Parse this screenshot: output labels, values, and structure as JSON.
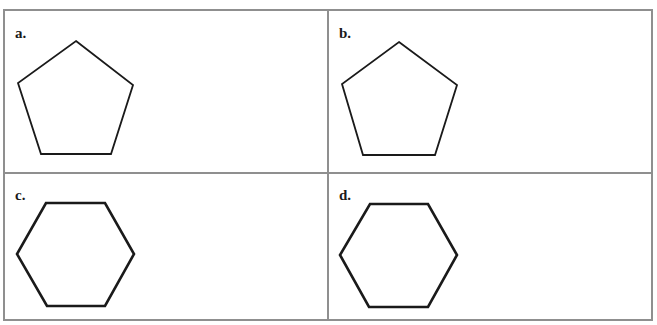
{
  "figure": {
    "cells": [
      {
        "id": "a",
        "label": "a.",
        "shape": "pentagon"
      },
      {
        "id": "b",
        "label": "b.",
        "shape": "pentagon"
      },
      {
        "id": "c",
        "label": "c.",
        "shape": "hexagon"
      },
      {
        "id": "d",
        "label": "d.",
        "shape": "hexagon"
      }
    ],
    "colors": {
      "border": "#8f8f8f",
      "stroke": "#1a1a1a",
      "background": "#ffffff"
    }
  }
}
